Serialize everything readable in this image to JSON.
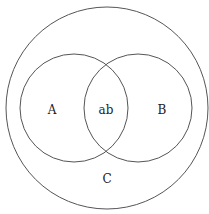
{
  "diagram": {
    "type": "venn",
    "sets": [
      {
        "id": "outer",
        "label": "C",
        "description": "universal / enclosing set"
      },
      {
        "id": "left",
        "label": "A"
      },
      {
        "id": "right",
        "label": "B"
      }
    ],
    "intersection_label": "ab",
    "colors": {
      "line": "#555555",
      "text": "#222222",
      "background": "#ffffff"
    }
  }
}
